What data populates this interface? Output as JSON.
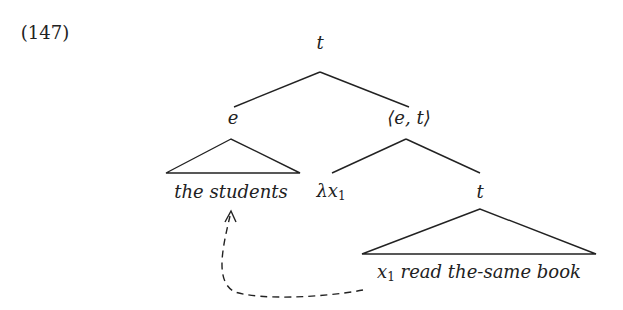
{
  "example_number": "(147)",
  "tree": {
    "root": "t",
    "left": {
      "label": "e",
      "leaf": "the students"
    },
    "right": {
      "label": "⟨e, t⟩",
      "binder": {
        "lambda": "λx",
        "index": "1"
      },
      "inner": {
        "label": "t",
        "leaf_var": "x",
        "leaf_index": "1",
        "leaf_rest": " read the-same book"
      }
    }
  },
  "arrow": {
    "style": "dashed",
    "from": "x1",
    "to": "the students"
  }
}
